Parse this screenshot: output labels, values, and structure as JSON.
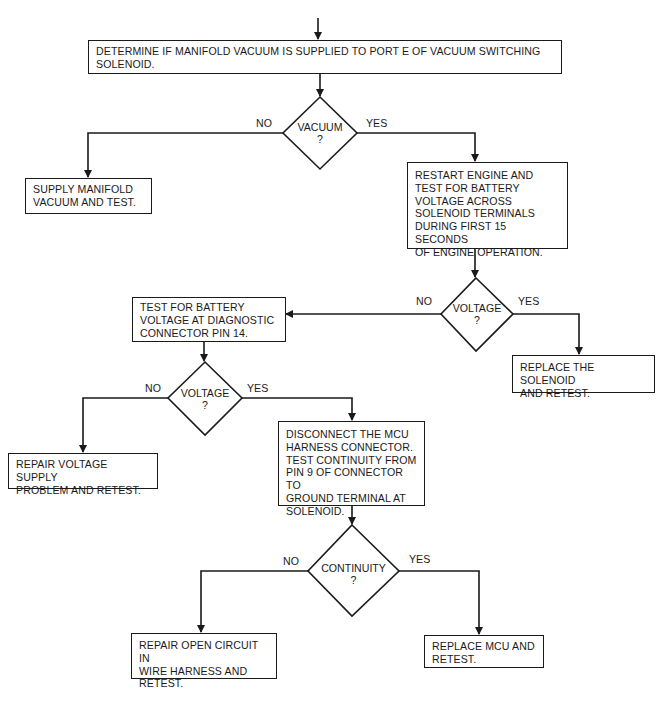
{
  "flowchart": {
    "start_box": "DETERMINE IF MANIFOLD VACUUM IS SUPPLIED TO PORT E OF VACUUM SWITCHING\nSOLENOID.",
    "vacuum_decision": {
      "label": "VACUUM\n?",
      "no": "NO",
      "yes": "YES"
    },
    "supply_vacuum_box": "SUPPLY MANIFOLD\nVACUUM AND TEST.",
    "restart_engine_box": "RESTART ENGINE AND\nTEST FOR BATTERY\nVOLTAGE ACROSS\nSOLENOID TERMINALS\nDURING FIRST 15 SECONDS\nOF ENGINE OPERATION.",
    "voltage_decision_1": {
      "label": "VOLTAGE\n?",
      "no": "NO",
      "yes": "YES"
    },
    "replace_solenoid_box": "REPLACE THE SOLENOID\nAND RETEST.",
    "test_pin14_box": "TEST FOR BATTERY\nVOLTAGE AT DIAGNOSTIC\nCONNECTOR PIN 14.",
    "voltage_decision_2": {
      "label": "VOLTAGE\n?",
      "no": "NO",
      "yes": "YES"
    },
    "repair_supply_box": "REPAIR VOLTAGE SUPPLY\nPROBLEM AND RETEST.",
    "disconnect_mcu_box": "DISCONNECT THE MCU\nHARNESS CONNECTOR.\nTEST CONTINUITY FROM\nPIN 9 OF CONNECTOR TO\nGROUND TERMINAL AT\nSOLENOID.",
    "continuity_decision": {
      "label": "CONTINUITY\n?",
      "no": "NO",
      "yes": "YES"
    },
    "repair_open_box": "REPAIR OPEN CIRCUIT IN\nWIRE HARNESS AND\nRETEST.",
    "replace_mcu_box": "REPLACE MCU AND\nRETEST."
  },
  "colors": {
    "ink": "#1a1a1a",
    "paper": "#ffffff"
  }
}
